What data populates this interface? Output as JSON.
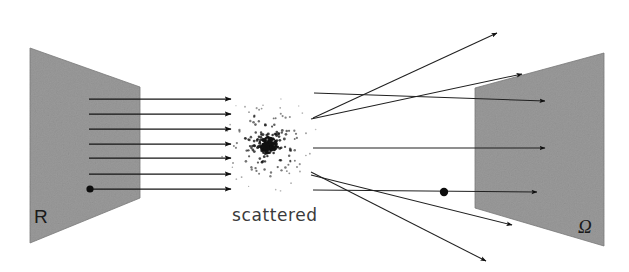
{
  "figure": {
    "caption": "scattered",
    "background_color": "#ffffff",
    "panel_fill_color": "#9a9a9a",
    "panel_edge_color": "#7d7d7d",
    "ray_color": "#151515"
  },
  "labels": {
    "source_plane": "R",
    "detector_plane": "Ω",
    "center_caption": "scattered"
  },
  "panels": {
    "source": {
      "name": "R",
      "points": "30,48 140,87 140,198 30,243",
      "label": "R",
      "label_x": 34,
      "label_y": 223
    },
    "detector": {
      "name": "Ω",
      "points": "475,88 604,53 604,246 475,208",
      "label": "Ω",
      "label_x": 578,
      "label_y": 233
    }
  },
  "incident_rays": {
    "count": 7,
    "x_start": 89,
    "x_end": 231,
    "y_values": [
      99,
      114,
      129,
      144,
      158,
      174,
      189
    ],
    "origin_dot_index": 6,
    "origin_dot_radius": 3.6
  },
  "scatter_cloud": {
    "center_x": 268,
    "center_y": 145,
    "core_radius": 9,
    "halo_radius": 52,
    "point_count": 260,
    "seed": 20240617
  },
  "outgoing_rays": [
    {
      "name": "ray-up-steep",
      "x1": 313,
      "y1": 118,
      "x2": 497,
      "y2": 33,
      "head": true
    },
    {
      "name": "ray-up-shallow",
      "x1": 311,
      "y1": 119,
      "x2": 522,
      "y2": 74,
      "head": true
    },
    {
      "name": "ray-up-flat",
      "x1": 314,
      "y1": 93,
      "x2": 545,
      "y2": 101,
      "head": true
    },
    {
      "name": "ray-middle",
      "x1": 313,
      "y1": 148,
      "x2": 545,
      "y2": 148,
      "head": true
    },
    {
      "name": "ray-down-flat",
      "x1": 313,
      "y1": 190,
      "x2": 537,
      "y2": 192,
      "head": true
    },
    {
      "name": "ray-down-shallow",
      "x1": 311,
      "y1": 175,
      "x2": 512,
      "y2": 225,
      "head": true
    },
    {
      "name": "ray-down-steep",
      "x1": 311,
      "y1": 172,
      "x2": 486,
      "y2": 261,
      "head": true
    }
  ],
  "detector_hit_dot": {
    "x": 444,
    "y": 192,
    "radius": 4.2
  }
}
